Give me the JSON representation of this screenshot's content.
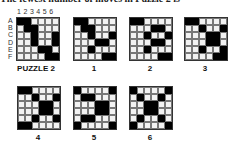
{
  "header_text": "The fewest number of moves in Puzzle 2 is",
  "column_numbers": "1 2 3 4 5 6",
  "row_labels": [
    "A",
    "B",
    "C",
    "D",
    "E",
    "F"
  ],
  "puzzles": [
    {
      "label": "PUZZLE 2",
      "x": 16,
      "y": 17,
      "rows": [
        "110000",
        "011000",
        "001001",
        "001001",
        "000110",
        "000011"
      ]
    },
    {
      "label": "1",
      "x": 73,
      "y": 17,
      "rows": [
        "110000",
        "011000",
        "001001",
        "000110",
        "001000",
        "000011"
      ]
    },
    {
      "label": "2",
      "x": 129,
      "y": 17,
      "rows": [
        "110000",
        "000110",
        "001001",
        "000110",
        "001000",
        "000011"
      ]
    },
    {
      "label": "3",
      "x": 184,
      "y": 17,
      "rows": [
        "110000",
        "001001",
        "000110",
        "000110",
        "001001",
        "000011"
      ]
    },
    {
      "label": "4",
      "x": 17,
      "y": 86,
      "rows": [
        "110000",
        "001001",
        "000110",
        "000110",
        "001001",
        "110000"
      ]
    },
    {
      "label": "5",
      "x": 73,
      "y": 86,
      "rows": [
        "100001",
        "011000",
        "000110",
        "000110",
        "011000",
        "100001"
      ]
    },
    {
      "label": "6",
      "x": 129,
      "y": 86,
      "rows": [
        "100001",
        "010010",
        "001100",
        "001100",
        "010010",
        "100001"
      ]
    }
  ]
}
